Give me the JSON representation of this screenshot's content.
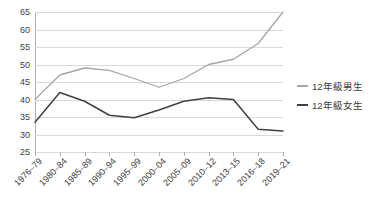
{
  "chart_data": {
    "type": "line",
    "title": "",
    "xlabel": "",
    "ylabel": "",
    "ylim": [
      25,
      65
    ],
    "ytick_step": 5,
    "yticks": [
      65,
      60,
      55,
      50,
      45,
      40,
      35,
      30,
      25
    ],
    "grid": true,
    "legend_position": "right",
    "categories": [
      "1976–79",
      "1980–84",
      "1985–89",
      "1990–94",
      "1995–99",
      "2000–04",
      "2005–09",
      "2010–12",
      "2013–15",
      "2016–18",
      "2019–21"
    ],
    "series": [
      {
        "name": "12年級男生",
        "color": "#a6a6a6",
        "values": [
          40.0,
          47.0,
          49.0,
          48.3,
          46.0,
          43.5,
          46.0,
          50.0,
          51.5,
          56.0,
          65.0
        ]
      },
      {
        "name": "12年級女生",
        "color": "#404040",
        "values": [
          33.5,
          42.0,
          39.5,
          35.5,
          34.8,
          37.0,
          39.5,
          40.5,
          40.0,
          31.5,
          31.0
        ]
      }
    ]
  },
  "colors": {
    "grid": "#d9d9d9",
    "axis": "#b0b0b0",
    "text": "#3d3d3d",
    "background": "#ffffff"
  }
}
